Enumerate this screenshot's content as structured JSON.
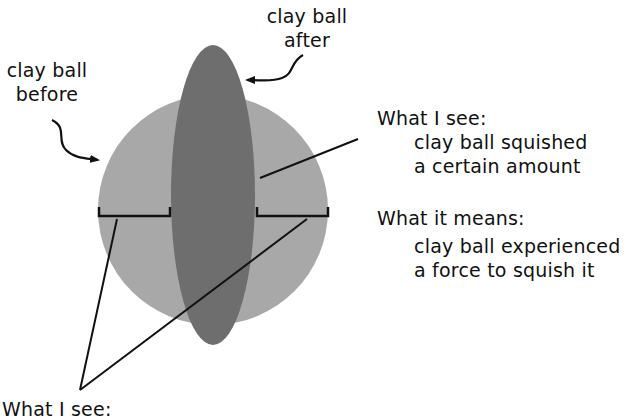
{
  "labels": {
    "before": [
      "clay ball",
      "before"
    ],
    "after": [
      "clay ball",
      "after"
    ],
    "see_right": {
      "heading": "What I see:",
      "lines": [
        "clay ball squished",
        "a certain amount"
      ]
    },
    "means_right": {
      "heading": "What it means:",
      "lines": [
        "clay ball experienced",
        "a force to squish it"
      ]
    },
    "see_bottom": {
      "heading": "What I see:"
    }
  },
  "colors": {
    "ball_before": "#a8a8a8",
    "ball_after": "#6e6e6e",
    "line": "#111111"
  }
}
